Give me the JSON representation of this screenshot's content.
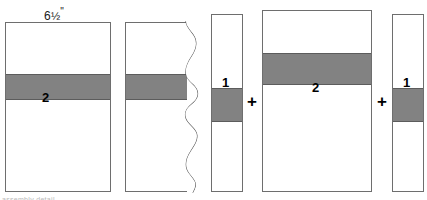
{
  "figure": {
    "title_label": "6½\"",
    "dimension": {
      "whole": "6",
      "fraction": "½",
      "unit": "\""
    },
    "operator": "+",
    "caption": "assembly detail"
  },
  "panels": [
    {
      "id": "panel-full-left",
      "name": "wall-section-full",
      "band_label": "2",
      "has_break_edge": false
    },
    {
      "id": "panel-broken",
      "name": "wall-section-broken",
      "band_label": "",
      "has_break_edge": true
    },
    {
      "id": "panel-narrow-left",
      "name": "layer-strip-one-left",
      "band_label": "1",
      "has_break_edge": false
    },
    {
      "id": "panel-wide-right",
      "name": "layer-strip-two",
      "band_label": "2",
      "has_break_edge": false
    },
    {
      "id": "panel-narrow-right",
      "name": "layer-strip-one-right",
      "band_label": "1",
      "has_break_edge": false
    }
  ],
  "colors": {
    "band_fill": "#828282",
    "outline": "#6e6e6e",
    "background": "#ffffff",
    "text": "#000000"
  }
}
